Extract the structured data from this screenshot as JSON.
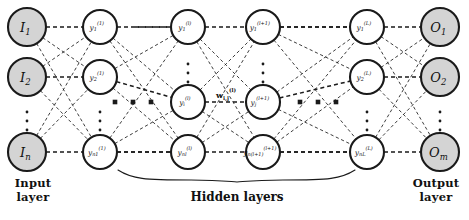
{
  "diagram": {
    "background": "#ffffff",
    "stroke_color": "#1a1a1a",
    "io_node_fill": "#d4d4d4",
    "hidden_node_fill": "#ffffff",
    "edge_style": "dashed",
    "captions": {
      "input": "Input\nlayer",
      "input_line1": "Input",
      "input_line2": "layer",
      "output_line1": "Output",
      "output_line2": "layer",
      "hidden": "Hidden layers"
    },
    "weight_label": "w",
    "weight_label_sub": "i,j",
    "weight_label_sup": "(l)",
    "columns": [
      {
        "id": "input",
        "kind": "io",
        "cx": 27,
        "r": 19,
        "fill": "#d4d4d4",
        "nodes": [
          {
            "base": "I",
            "sub": "1",
            "sup": "",
            "cy": 27
          },
          {
            "base": "I",
            "sub": "2",
            "sup": "",
            "cy": 77
          },
          {
            "base": "I",
            "sub": "n",
            "sup": "",
            "cy": 152
          }
        ]
      },
      {
        "id": "hidden-1",
        "kind": "hidden",
        "cx": 100,
        "r": 17,
        "fill": "#ffffff",
        "nodes": [
          {
            "base": "y",
            "sub": "1",
            "sup": "(1)",
            "cy": 27
          },
          {
            "base": "y",
            "sub": "2",
            "sup": "(1)",
            "cy": 77
          },
          {
            "base": "y",
            "sub": "n1",
            "sup": "(1)",
            "cy": 152
          }
        ]
      },
      {
        "id": "hidden-l",
        "kind": "hidden",
        "cx": 188,
        "r": 17,
        "fill": "#ffffff",
        "nodes": [
          {
            "base": "y",
            "sub": "1",
            "sup": "(l)",
            "cy": 27
          },
          {
            "base": "y",
            "sub": "i",
            "sup": "(l)",
            "cy": 102
          },
          {
            "base": "y",
            "sub": "nl",
            "sup": "(l)",
            "cy": 152
          }
        ]
      },
      {
        "id": "hidden-l-plus-1",
        "kind": "hidden",
        "cx": 263,
        "r": 17,
        "fill": "#ffffff",
        "nodes": [
          {
            "base": "y",
            "sub": "1",
            "sup": "(l+1)",
            "cy": 27
          },
          {
            "base": "y",
            "sub": "j",
            "sup": "(l+1)",
            "cy": 102
          },
          {
            "base": "y",
            "sub": "n(l+1)",
            "sup": "(l+1)",
            "cy": 152
          }
        ]
      },
      {
        "id": "hidden-L",
        "kind": "hidden",
        "cx": 367,
        "r": 17,
        "fill": "#ffffff",
        "nodes": [
          {
            "base": "y",
            "sub": "1",
            "sup": "(L)",
            "cy": 27
          },
          {
            "base": "y",
            "sub": "2",
            "sup": "(L)",
            "cy": 77
          },
          {
            "base": "y",
            "sub": "nL",
            "sup": "(L)",
            "cy": 152
          }
        ]
      },
      {
        "id": "output",
        "kind": "io",
        "cx": 440,
        "r": 19,
        "fill": "#d4d4d4",
        "nodes": [
          {
            "base": "O",
            "sub": "1",
            "sup": "",
            "cy": 27
          },
          {
            "base": "O",
            "sub": "2",
            "sup": "",
            "cy": 77
          },
          {
            "base": "O",
            "sub": "m",
            "sup": "",
            "cy": 152
          }
        ]
      }
    ],
    "vertical_ellipses": [
      {
        "cx": 27,
        "cy": 112
      },
      {
        "cx": 100,
        "cy": 112
      },
      {
        "cx": 188,
        "cy": 64
      },
      {
        "cx": 263,
        "cy": 64
      },
      {
        "cx": 367,
        "cy": 112
      },
      {
        "cx": 440,
        "cy": 112
      }
    ],
    "horizontal_ellipses": [
      {
        "cy": 102,
        "xs": [
          115,
          133,
          151
        ]
      },
      {
        "cy": 102,
        "xs": [
          300,
          318,
          336
        ]
      }
    ],
    "brace": {
      "x1": 118,
      "x2": 355,
      "y": 170,
      "apex_x": 237,
      "apex_y": 182
    }
  }
}
